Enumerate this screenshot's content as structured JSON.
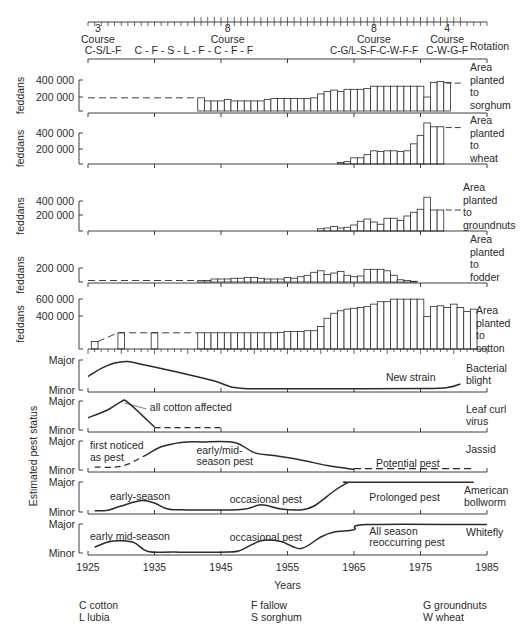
{
  "chart_data": {
    "type": "bar",
    "xlabel": "Years",
    "x_ticks": [
      1925,
      1935,
      1945,
      1955,
      1965,
      1975,
      1985
    ],
    "xlim": [
      1925,
      1985
    ],
    "rotation": {
      "label": "Rotation",
      "segments": [
        {
          "number": "3",
          "course": "Course",
          "sequence": "C-S/L-F",
          "x_center": 1926.5
        },
        {
          "number": "",
          "course": "",
          "sequence": "C  -  F  -  S  -  L  -  F  -  C  -  F  -  F",
          "x_center": 1945
        },
        {
          "number": "8",
          "course": "Course",
          "sequence": "",
          "x_center": 1946
        },
        {
          "number": "8",
          "course": "Course",
          "sequence": "C-G/L-S-F-C-W-F-F",
          "x_center": 1968
        },
        {
          "number": "4",
          "course": "Course",
          "sequence": "C-W-G-F",
          "x_center": 1979
        }
      ]
    },
    "area_panels": [
      {
        "name": "sorghum",
        "ylabel": "feddans",
        "ticks": [
          "400 000",
          "200 000"
        ],
        "label_lines": [
          "Area",
          "planted",
          "to",
          "sorghum"
        ],
        "ymax": 500000,
        "dashed_before": {
          "from": 1925,
          "to": 1941.5,
          "value": 170000
        },
        "dashed_after": {
          "from": 1978.5,
          "to": 1981,
          "value": 360000
        },
        "bars": {
          "start_year": 1941.5,
          "values": [
            170000,
            130000,
            130000,
            130000,
            150000,
            130000,
            130000,
            130000,
            130000,
            130000,
            150000,
            160000,
            160000,
            160000,
            160000,
            160000,
            160000,
            170000,
            220000,
            250000,
            270000,
            250000,
            280000,
            280000,
            280000,
            290000,
            320000,
            320000,
            320000,
            320000,
            320000,
            320000,
            320000,
            320000,
            180000,
            370000,
            380000,
            370000
          ]
        }
      },
      {
        "name": "wheat",
        "ylabel": "feddans",
        "ticks": [
          "400 000",
          "200 000"
        ],
        "label_lines": [
          "Area",
          "planted",
          "to",
          "wheat"
        ],
        "ymax": 500000,
        "dashed_after": {
          "from": 1978.5,
          "to": 1981,
          "value": 470000
        },
        "bars": {
          "start_year": 1962.5,
          "values": [
            20000,
            30000,
            80000,
            80000,
            120000,
            170000,
            160000,
            170000,
            170000,
            160000,
            170000,
            260000,
            370000,
            530000,
            480000,
            480000
          ]
        }
      },
      {
        "name": "groundnuts",
        "ylabel": "feddans",
        "ticks": [
          "400 000",
          "200 000"
        ],
        "label_lines": [
          "Area",
          "planted",
          "to",
          "groundnuts"
        ],
        "ymax": 500000,
        "dashed_after": {
          "from": 1978.5,
          "to": 1981,
          "value": 280000
        },
        "bars": {
          "start_year": 1959.5,
          "values": [
            30000,
            40000,
            60000,
            40000,
            50000,
            80000,
            130000,
            160000,
            120000,
            90000,
            170000,
            170000,
            140000,
            200000,
            250000,
            290000,
            450000,
            280000,
            280000
          ]
        }
      },
      {
        "name": "fodder",
        "ylabel": "feddans",
        "ticks": [
          "200 000"
        ],
        "label_lines": [
          "Area",
          "planted",
          "to",
          "fodder"
        ],
        "ymax": 300000,
        "dashed_before": {
          "from": 1925,
          "to": 1941.5,
          "value": 20000
        },
        "bars": {
          "start_year": 1941.5,
          "values": [
            20000,
            20000,
            40000,
            40000,
            40000,
            50000,
            50000,
            60000,
            60000,
            50000,
            40000,
            40000,
            40000,
            60000,
            50000,
            70000,
            90000,
            130000,
            150000,
            100000,
            120000,
            140000,
            90000,
            70000,
            80000,
            170000,
            170000,
            170000,
            150000,
            90000,
            30000,
            20000,
            10000
          ]
        }
      },
      {
        "name": "cotton",
        "ylabel": "feddans",
        "ticks": [
          "600 000",
          "400 000"
        ],
        "label_lines": [
          "Area",
          "planted",
          "to",
          "cotton"
        ],
        "ymax": 680000,
        "dashed_before": {
          "from": 1926.5,
          "to": 1941.5,
          "value": 195000
        },
        "bars": {
          "start_year": 1925.5,
          "values": [
            90000,
            0,
            0,
            0,
            195000,
            0,
            0,
            0,
            0,
            195000,
            0,
            0,
            0,
            0,
            0,
            0,
            195000,
            195000,
            195000,
            195000,
            195000,
            195000,
            195000,
            195000,
            195000,
            195000,
            195000,
            195000,
            200000,
            210000,
            210000,
            210000,
            220000,
            220000,
            270000,
            370000,
            430000,
            460000,
            480000,
            490000,
            500000,
            510000,
            540000,
            570000,
            570000,
            600000,
            600000,
            600000,
            600000,
            600000,
            390000,
            510000,
            520000,
            500000,
            540000,
            500000,
            450000,
            480000
          ]
        }
      }
    ],
    "pest_panels": {
      "ylabel": "Estimated pest status",
      "levels": [
        "Major",
        "Minor"
      ],
      "pests": [
        {
          "name": "Bacterial blight",
          "label_lines": [
            "Bacterial",
            "blight"
          ],
          "annotations": [
            {
              "text": "New strain",
              "year": 1969.5,
              "level": 0.45
            }
          ],
          "solid": [
            [
              1925,
              0.45
            ],
            [
              1927,
              0.72
            ],
            [
              1929,
              0.9
            ],
            [
              1931,
              0.95
            ],
            [
              1933,
              0.86
            ],
            [
              1936,
              0.72
            ],
            [
              1940,
              0.52
            ],
            [
              1944,
              0.3
            ],
            [
              1947,
              0.08
            ],
            [
              1950,
              0.04
            ],
            [
              1960,
              0.04
            ],
            [
              1975,
              0.05
            ],
            [
              1979,
              0.08
            ],
            [
              1981,
              0.2
            ]
          ],
          "dashed": []
        },
        {
          "name": "Leaf curl virus",
          "label_lines": [
            "Leaf curl",
            "virus"
          ],
          "annotations": [
            {
              "text": "all cotton affected",
              "year": 1934,
              "level": 0.8
            }
          ],
          "solid": [
            [
              1925,
              0.42
            ],
            [
              1928,
              0.7
            ],
            [
              1930,
              0.98
            ],
            [
              1931,
              0.95
            ],
            [
              1935,
              0.1
            ]
          ],
          "dashed": [
            [
              1935,
              0.08
            ],
            [
              1945,
              0.08
            ]
          ]
        },
        {
          "name": "Jassid",
          "label_lines": [
            "Jassid"
          ],
          "annotations": [
            {
              "text": "first noticed",
              "year": 1925,
              "level": 0.85
            },
            {
              "text": "as pest",
              "year": 1925,
              "level": 0.45
            },
            {
              "text": "early/mid-",
              "year": 1941,
              "level": 0.7
            },
            {
              "text": "season pest",
              "year": 1941,
              "level": 0.3
            },
            {
              "text": "Potential pest",
              "year": 1968,
              "level": 0.25
            }
          ],
          "solid": [
            [
              1934,
              0.55
            ],
            [
              1936,
              0.8
            ],
            [
              1939,
              0.95
            ],
            [
              1942,
              0.97
            ],
            [
              1947,
              0.95
            ],
            [
              1950,
              0.6
            ],
            [
              1953,
              0.5
            ],
            [
              1957,
              0.35
            ],
            [
              1961,
              0.15
            ],
            [
              1965,
              0.02
            ]
          ],
          "dashed": [
            [
              1926,
              0.1
            ],
            [
              1929,
              0.1
            ],
            [
              1931,
              0.2
            ],
            [
              1934,
              0.55
            ]
          ],
          "dashed2": [
            [
              1965,
              0.05
            ],
            [
              1983,
              0.05
            ]
          ]
        },
        {
          "name": "American bollworm",
          "label_lines": [
            "American",
            "bollworm"
          ],
          "annotations": [
            {
              "text": "early-season",
              "year": 1928,
              "level": 0.55
            },
            {
              "text": "occasional pest",
              "year": 1946,
              "level": 0.45
            },
            {
              "text": "Prolonged pest",
              "year": 1967,
              "level": 0.5
            }
          ],
          "solid": [
            [
              1926,
              0.04
            ],
            [
              1928,
              0.06
            ],
            [
              1930,
              0.2
            ],
            [
              1933,
              0.38
            ],
            [
              1935,
              0.3
            ],
            [
              1937,
              0.1
            ],
            [
              1940,
              0.07
            ],
            [
              1948,
              0.08
            ],
            [
              1951,
              0.24
            ],
            [
              1954,
              0.1
            ],
            [
              1957,
              0.07
            ],
            [
              1959,
              0.2
            ],
            [
              1962,
              0.7
            ],
            [
              1964,
              0.97
            ],
            [
              1965,
              0.99
            ],
            [
              1983,
              0.99
            ]
          ],
          "dashed": []
        },
        {
          "name": "Whitefly",
          "label_lines": [
            "Whitefly"
          ],
          "annotations": [
            {
              "text": "early mid-season",
              "year": 1925,
              "level": 0.6
            },
            {
              "text": "occasional pest",
              "year": 1946,
              "level": 0.55
            },
            {
              "text": "All season",
              "year": 1967,
              "level": 0.75
            },
            {
              "text": "reoccurring pest",
              "year": 1967,
              "level": 0.38
            }
          ],
          "solid": [
            [
              1926,
              0.2
            ],
            [
              1928,
              0.38
            ],
            [
              1930,
              0.42
            ],
            [
              1932,
              0.35
            ],
            [
              1934,
              0.05
            ],
            [
              1938,
              0.03
            ],
            [
              1946,
              0.03
            ],
            [
              1948,
              0.1
            ],
            [
              1951,
              0.42
            ],
            [
              1954,
              0.4
            ],
            [
              1957,
              0.15
            ],
            [
              1960,
              0.55
            ],
            [
              1962,
              0.72
            ],
            [
              1965,
              0.8
            ],
            [
              1967,
              0.98
            ],
            [
              1985,
              0.98
            ]
          ],
          "dashed": []
        }
      ]
    },
    "legend": [
      [
        "C cotton",
        "L lubia"
      ],
      [
        "F fallow",
        "S sorghum"
      ],
      [
        "G groundnuts",
        "W wheat"
      ]
    ]
  }
}
